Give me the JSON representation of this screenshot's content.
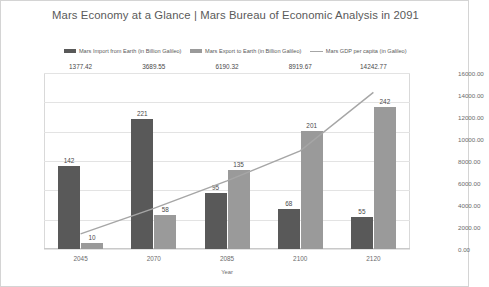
{
  "chart_data": {
    "type": "bar",
    "title": "Mars Economy at a Glance | Mars Bureau of Economic Analysis in 2091",
    "xlabel": "Year",
    "ylabel": "",
    "categories": [
      "2045",
      "2070",
      "2085",
      "2100",
      "2120"
    ],
    "series": [
      {
        "name": "Mars Import from Earth (in Billion Galileo)",
        "type": "bar",
        "axis": "left",
        "color": "#595959",
        "values": [
          142,
          221,
          95,
          68,
          55
        ]
      },
      {
        "name": "Mars Export to Earth (in Billion Galileo)",
        "type": "bar",
        "axis": "left",
        "color": "#9a9a9a",
        "values": [
          10,
          58,
          135,
          201,
          242
        ]
      },
      {
        "name": "Mars GDP per capita (in Galileo)",
        "type": "line",
        "axis": "right",
        "color": "#a6a6a6",
        "values": [
          1377.42,
          3689.55,
          6190.32,
          8919.67,
          14242.77
        ],
        "value_labels": [
          "1377.42",
          "3689.55",
          "6190.32",
          "8919.67",
          "14242.77"
        ]
      }
    ],
    "ylim": [
      0,
      300
    ],
    "y2lim": [
      0,
      16000
    ],
    "yticks": [
      "0",
      "50",
      "100",
      "150",
      "200",
      "250",
      "300"
    ],
    "y2ticks": [
      "0.00",
      "2000.00",
      "4000.00",
      "6000.00",
      "8000.00",
      "10000.00",
      "12000.00",
      "14000.00",
      "16000.00"
    ],
    "grid": true,
    "legend_position": "top"
  },
  "legend": {
    "items": [
      {
        "label": "Mars Import from Earth (in Billion Galileo)",
        "marker": "swatch",
        "color": "#595959"
      },
      {
        "label": "Mars Export to Earth (in Billion Galileo)",
        "marker": "swatch",
        "color": "#9a9a9a"
      },
      {
        "label": "Mars GDP per capita (in Galileo)",
        "marker": "line",
        "color": "#a6a6a6"
      }
    ]
  }
}
